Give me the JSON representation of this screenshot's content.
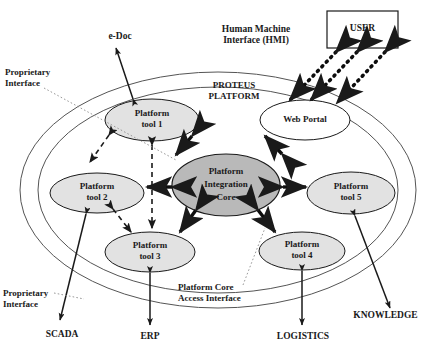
{
  "diagram": {
    "platform_label": "PROTEUS\nPLATFORM",
    "colors": {
      "core_fill": "#b9b9b9",
      "tool_fill": "#e2e2e2",
      "portal_fill": "#ffffff",
      "stroke": "#1a1a1a",
      "background": "#ffffff"
    },
    "core": {
      "label": "Platform\nIntegration\nCore",
      "name": "platform-integration-core"
    },
    "nodes": [
      {
        "id": "tool1",
        "label": "Platform\ntool 1",
        "fill": "#e2e2e2"
      },
      {
        "id": "webportal",
        "label": "Web Portal",
        "fill": "#ffffff"
      },
      {
        "id": "tool2",
        "label": "Platform\ntool 2",
        "fill": "#e2e2e2"
      },
      {
        "id": "tool5",
        "label": "Platform\ntool 5",
        "fill": "#e2e2e2"
      },
      {
        "id": "tool3",
        "label": "Platform\ntool 3",
        "fill": "#e2e2e2"
      },
      {
        "id": "tool4",
        "label": "Platform\ntool 4",
        "fill": "#e2e2e2"
      }
    ],
    "user_box": {
      "label": "USER",
      "name": "user-box"
    },
    "external_labels": [
      {
        "id": "edoc",
        "label": "e-Doc"
      },
      {
        "id": "hmi",
        "label": "Human Machine\nInterface (HMI)"
      },
      {
        "id": "scada",
        "label": "SCADA"
      },
      {
        "id": "erp",
        "label": "ERP"
      },
      {
        "id": "logistics",
        "label": "LOGISTICS"
      },
      {
        "id": "knowledge",
        "label": "KNOWLEDGE"
      }
    ],
    "annotations": [
      {
        "id": "proprietary-top",
        "label": "Proprietary\nInterface"
      },
      {
        "id": "proprietary-bottom",
        "label": "Proprietary\nInterface"
      },
      {
        "id": "core-access",
        "label": "Platform Core\nAccess Interface"
      }
    ]
  }
}
